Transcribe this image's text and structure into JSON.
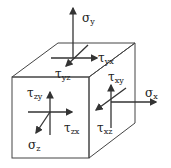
{
  "diagram": {
    "title": "",
    "type": "3D stress element",
    "colors": {
      "line": "#333333",
      "background": "#ffffff"
    },
    "labels": {
      "sigma_y": {
        "symbol": "σ",
        "sub": "y"
      },
      "tau_yx": {
        "symbol": "τ",
        "sub": "yx"
      },
      "tau_yz": {
        "symbol": "τ",
        "sub": "yz"
      },
      "tau_xy": {
        "symbol": "τ",
        "sub": "xy"
      },
      "sigma_x": {
        "symbol": "σ",
        "sub": "x"
      },
      "tau_xz": {
        "symbol": "τ",
        "sub": "xz"
      },
      "tau_zy": {
        "symbol": "τ",
        "sub": "zy"
      },
      "tau_zx": {
        "symbol": "τ",
        "sub": "zx"
      },
      "sigma_z": {
        "symbol": "σ",
        "sub": "z"
      }
    }
  }
}
